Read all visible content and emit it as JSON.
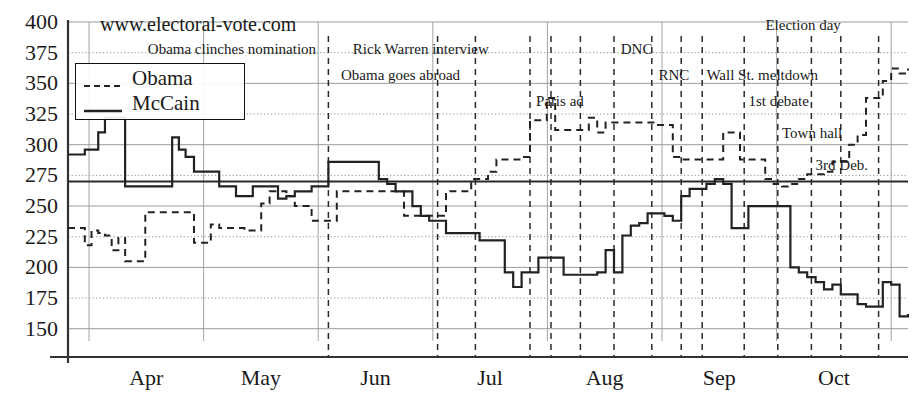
{
  "site_label": "www.electoral-vote.com",
  "legend": {
    "position": "top-left",
    "entries": [
      {
        "name": "Obama",
        "style": "dashed",
        "icon": "dashed-line-swatch"
      },
      {
        "name": "McCain",
        "style": "solid",
        "icon": "solid-line-swatch"
      }
    ]
  },
  "colors": {
    "line": "#222222",
    "grid": "#9a9a9a",
    "dotted_grid": "#8d8d8d",
    "axis": "#333333",
    "threshold": "#2a2a2a",
    "event_line": "#2a2a2a",
    "background": "#ffffff"
  },
  "chart_data": {
    "type": "line",
    "title": "www.electoral-vote.com",
    "xlabel": "",
    "ylabel": "",
    "ylim": [
      140,
      400
    ],
    "yticks": [
      150,
      175,
      200,
      225,
      250,
      275,
      300,
      325,
      350,
      375,
      400
    ],
    "ytick_labels": [
      "150",
      "175",
      "200",
      "225",
      "250",
      "275",
      "300",
      "325",
      "350",
      "375",
      "400"
    ],
    "xtick_labels": [
      "Apr",
      "May",
      "Jun",
      "Jul",
      "Aug",
      "Sep",
      "Oct"
    ],
    "xlim": [
      0,
      100
    ],
    "grid": true,
    "threshold_line": {
      "value": 270,
      "label": "270 electoral votes",
      "style": "solid-thick"
    },
    "legend_position": "top-left",
    "series": [
      {
        "name": "Obama",
        "style": "dashed",
        "x": [
          0,
          1.2,
          2.0,
          2.8,
          3.6,
          4.4,
          5.2,
          6.0,
          6.8,
          7.6,
          8.4,
          9.2,
          10.0,
          10.8,
          11.6,
          12.4,
          13.2,
          14.0,
          15.0,
          16.0,
          17.0,
          18.0,
          19.0,
          20.0,
          21.0,
          22.0,
          23.0,
          24.0,
          25.0,
          26.0,
          27.0,
          28.0,
          29.0,
          30.0,
          31.0,
          32.0,
          33.0,
          34.0,
          35.0,
          36.0,
          37.0,
          38.0,
          39.0,
          40.0,
          41.0,
          42.0,
          43.0,
          44.0,
          45.0,
          46.0,
          47.0,
          48.0,
          49.0,
          50.0,
          51.0,
          52.0,
          53.0,
          54.0,
          55.0,
          56.0,
          57.0,
          58.0,
          59.0,
          60.0,
          61.0,
          62.0,
          63.0,
          64.0,
          65.0,
          66.0,
          67.0,
          68.0,
          69.0,
          70.0,
          71.0,
          72.0,
          73.0,
          74.0,
          75.0,
          76.0,
          77.0,
          78.0,
          79.0,
          80.0,
          81.0,
          82.0,
          83.0,
          84.0,
          85.0,
          86.0,
          87.0,
          88.0,
          89.0,
          90.0,
          91.0,
          92.0,
          93.0,
          94.0,
          95.0,
          96.0,
          97.0,
          98.0,
          99.0,
          100.0
        ],
        "y": [
          232,
          232,
          218,
          230,
          228,
          226,
          214,
          224,
          205,
          205,
          205,
          245,
          245,
          245,
          245,
          245,
          245,
          245,
          220,
          220,
          235,
          232,
          232,
          232,
          230,
          230,
          252,
          262,
          262,
          258,
          250,
          250,
          238,
          238,
          238,
          262,
          262,
          262,
          262,
          262,
          262,
          262,
          262,
          242,
          242,
          242,
          242,
          242,
          262,
          262,
          262,
          272,
          272,
          278,
          288,
          288,
          288,
          290,
          320,
          320,
          338,
          312,
          312,
          312,
          312,
          322,
          310,
          318,
          318,
          318,
          318,
          318,
          318,
          316,
          316,
          290,
          288,
          288,
          288,
          288,
          288,
          310,
          310,
          288,
          288,
          288,
          272,
          268,
          266,
          268,
          272,
          276,
          276,
          278,
          286,
          286,
          300,
          308,
          338,
          338,
          352,
          362,
          358,
          362
        ]
      },
      {
        "name": "McCain",
        "style": "solid",
        "x": [
          0,
          1.2,
          2.0,
          2.8,
          3.6,
          4.4,
          5.2,
          6.0,
          6.8,
          7.6,
          8.4,
          9.2,
          10.0,
          10.8,
          11.6,
          12.4,
          13.2,
          14.0,
          15.0,
          16.0,
          17.0,
          18.0,
          19.0,
          20.0,
          21.0,
          22.0,
          23.0,
          24.0,
          25.0,
          26.0,
          27.0,
          28.0,
          29.0,
          30.0,
          31.0,
          32.0,
          33.0,
          34.0,
          35.0,
          36.0,
          37.0,
          38.0,
          39.0,
          40.0,
          41.0,
          42.0,
          43.0,
          44.0,
          45.0,
          46.0,
          47.0,
          48.0,
          49.0,
          50.0,
          51.0,
          52.0,
          53.0,
          54.0,
          55.0,
          56.0,
          57.0,
          58.0,
          59.0,
          60.0,
          61.0,
          62.0,
          63.0,
          64.0,
          65.0,
          66.0,
          67.0,
          68.0,
          69.0,
          70.0,
          71.0,
          72.0,
          73.0,
          74.0,
          75.0,
          76.0,
          77.0,
          78.0,
          79.0,
          80.0,
          81.0,
          82.0,
          83.0,
          84.0,
          85.0,
          86.0,
          87.0,
          88.0,
          89.0,
          90.0,
          91.0,
          92.0,
          93.0,
          94.0,
          95.0,
          96.0,
          97.0,
          98.0,
          99.0,
          100.0
        ],
        "y": [
          292,
          292,
          296,
          296,
          310,
          322,
          322,
          322,
          266,
          266,
          266,
          266,
          266,
          266,
          266,
          306,
          296,
          290,
          278,
          278,
          278,
          266,
          266,
          258,
          258,
          266,
          266,
          266,
          256,
          258,
          262,
          262,
          266,
          266,
          286,
          286,
          286,
          286,
          286,
          286,
          272,
          268,
          262,
          262,
          250,
          242,
          238,
          238,
          228,
          228,
          228,
          228,
          222,
          222,
          222,
          196,
          184,
          196,
          196,
          208,
          208,
          208,
          194,
          194,
          194,
          194,
          196,
          214,
          196,
          226,
          234,
          236,
          244,
          244,
          242,
          238,
          258,
          264,
          264,
          268,
          272,
          268,
          232,
          232,
          250,
          250,
          250,
          250,
          250,
          200,
          196,
          192,
          188,
          182,
          186,
          178,
          178,
          170,
          168,
          168,
          188,
          186,
          160,
          162
        ]
      }
    ],
    "annotations": [
      {
        "text": "Obama clinches nomination",
        "x": 9.5,
        "row": 1,
        "align": "right-of-line",
        "line_x": 31.0
      },
      {
        "text": "Obama goes abroad",
        "x": 32.5,
        "row": 2,
        "align": "right-of-line",
        "line_x": 31.0
      },
      {
        "text": "Rick Warren interview",
        "x": 42.0,
        "row": 1,
        "align": "center",
        "line_x": 55.0
      },
      {
        "text": "Paris ad",
        "x": 55.7,
        "row": 3,
        "align": "right-of-line",
        "line_x": 55.0
      },
      {
        "text": "DNC",
        "x": 65.8,
        "row": 1,
        "align": "right-of-line",
        "line_x": 65.0
      },
      {
        "text": "RNC",
        "x": 70.3,
        "row": 2,
        "align": "right-of-line",
        "line_x": 69.5
      },
      {
        "text": "Wall St. meltdown",
        "x": 76.0,
        "row": 2,
        "align": "right-of-line",
        "line_x": 75.5
      },
      {
        "text": "1st debate",
        "x": 81.0,
        "row": 3,
        "align": "right-of-line",
        "line_x": 80.5
      },
      {
        "text": "Town hall",
        "x": 85.0,
        "row": 4,
        "align": "right-of-line",
        "line_x": 84.5
      },
      {
        "text": "3rd Deb.",
        "x": 89.0,
        "row": 5,
        "align": "right-of-line",
        "line_x": 92.0
      },
      {
        "text": "Election day",
        "x": 92.0,
        "row": 0,
        "align": "left-of-line",
        "line_x": 96.5
      }
    ],
    "event_lines_x": [
      31.0,
      55.0,
      57.5,
      65.0,
      69.5,
      75.5,
      80.5,
      84.5,
      88.5,
      92.0,
      96.5,
      44.0,
      48.5,
      61.0,
      73.0
    ]
  }
}
